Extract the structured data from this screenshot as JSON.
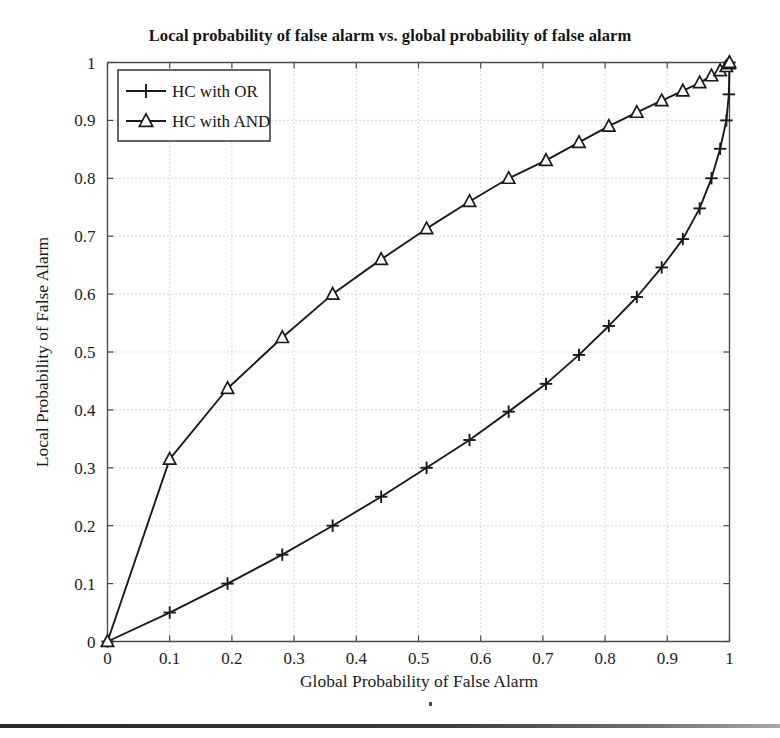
{
  "figure": {
    "title": "Local probability of false alarm vs. global probability of false alarm",
    "background_color": "#ffffff",
    "line_color": "#1a1a1a",
    "grid_color": "#b4b4b4"
  },
  "legend": {
    "position": "top-left",
    "entries": [
      {
        "label": "HC with OR",
        "marker": "plus-marker"
      },
      {
        "label": "HC with AND",
        "marker": "triangle-marker"
      }
    ]
  },
  "axes": {
    "x": {
      "label": "Global Probability of False Alarm",
      "ticks": [
        "0",
        "0.1",
        "0.2",
        "0.3",
        "0.4",
        "0.5",
        "0.6",
        "0.7",
        "0.8",
        "0.9",
        "1"
      ],
      "min": 0,
      "max": 1
    },
    "y": {
      "label": "Local Probability of False Alarm",
      "ticks": [
        "0",
        "0.1",
        "0.2",
        "0.3",
        "0.4",
        "0.5",
        "0.6",
        "0.7",
        "0.8",
        "0.9",
        "1"
      ],
      "min": 0,
      "max": 1
    }
  },
  "chart_data": {
    "type": "line",
    "title": "Local probability of false alarm vs. global probability of false alarm",
    "xlabel": "Global Probability of False Alarm",
    "ylabel": "Local Probability of False Alarm",
    "xlim": [
      0,
      1
    ],
    "ylim": [
      0,
      1
    ],
    "grid": true,
    "legend_position": "top-left",
    "series": [
      {
        "name": "HC with OR",
        "marker": "plus",
        "points": [
          [
            0.0,
            0.0
          ],
          [
            0.1,
            0.05
          ],
          [
            0.193,
            0.1
          ],
          [
            0.281,
            0.15
          ],
          [
            0.362,
            0.2
          ],
          [
            0.44,
            0.25
          ],
          [
            0.513,
            0.3
          ],
          [
            0.582,
            0.348
          ],
          [
            0.645,
            0.397
          ],
          [
            0.705,
            0.445
          ],
          [
            0.758,
            0.495
          ],
          [
            0.806,
            0.545
          ],
          [
            0.851,
            0.595
          ],
          [
            0.891,
            0.646
          ],
          [
            0.925,
            0.695
          ],
          [
            0.952,
            0.748
          ],
          [
            0.971,
            0.8
          ],
          [
            0.985,
            0.851
          ],
          [
            0.995,
            0.9
          ],
          [
            0.999,
            0.945
          ],
          [
            1.0,
            1.0
          ]
        ]
      },
      {
        "name": "HC with AND",
        "marker": "triangle",
        "points": [
          [
            0.0,
            0.0
          ],
          [
            0.1,
            0.315
          ],
          [
            0.193,
            0.437
          ],
          [
            0.281,
            0.525
          ],
          [
            0.362,
            0.6
          ],
          [
            0.44,
            0.66
          ],
          [
            0.513,
            0.713
          ],
          [
            0.582,
            0.76
          ],
          [
            0.645,
            0.8
          ],
          [
            0.705,
            0.831
          ],
          [
            0.758,
            0.862
          ],
          [
            0.806,
            0.89
          ],
          [
            0.851,
            0.914
          ],
          [
            0.891,
            0.934
          ],
          [
            0.925,
            0.951
          ],
          [
            0.952,
            0.965
          ],
          [
            0.971,
            0.977
          ],
          [
            0.985,
            0.986
          ],
          [
            0.995,
            0.993
          ],
          [
            0.999,
            0.998
          ],
          [
            1.0,
            1.0
          ]
        ]
      }
    ]
  }
}
